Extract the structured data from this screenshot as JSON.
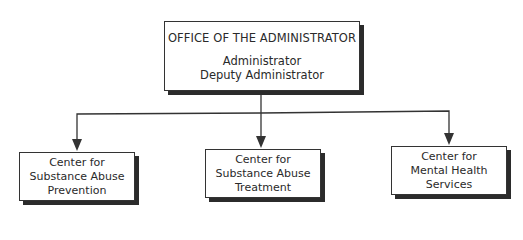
{
  "diagram": {
    "type": "org-chart",
    "root": {
      "title": "OFFICE OF THE ADMINISTRATOR",
      "lines": [
        "Administrator",
        "Deputy Administrator"
      ]
    },
    "children": [
      {
        "lines": [
          "Center for",
          "Substance Abuse",
          "Prevention"
        ]
      },
      {
        "lines": [
          "Center for",
          "Substance Abuse",
          "Treatment"
        ]
      },
      {
        "lines": [
          "Center for",
          "Mental Health",
          "Services"
        ]
      }
    ],
    "edges": [
      {
        "from": "root",
        "to": "children.0"
      },
      {
        "from": "root",
        "to": "children.1"
      },
      {
        "from": "root",
        "to": "children.2"
      }
    ],
    "colors": {
      "line": "#333333",
      "shadow": "#2b2b2b",
      "background": "#ffffff"
    }
  }
}
